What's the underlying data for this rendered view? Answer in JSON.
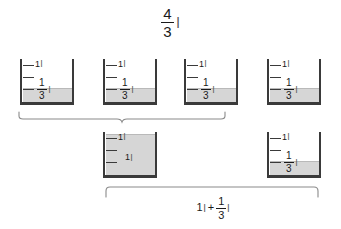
{
  "diagram": {
    "title_expression": {
      "numerator": "4",
      "denominator": "3",
      "unit": "l"
    },
    "sum_expression": {
      "whole": "1",
      "whole_unit": "l",
      "operator": "+",
      "numerator": "1",
      "denominator": "3",
      "unit": "l"
    },
    "beaker_scale_top_label": "1",
    "beaker_scale_top_unit": "l",
    "row_top": {
      "beakers": [
        {
          "id": "beaker-top-1",
          "top_label": "1",
          "top_unit": "l",
          "level_numerator": "1",
          "level_denominator": "3",
          "level_unit": "l",
          "fill_fraction": "1/3",
          "fill_height_px": 13,
          "x": 20
        },
        {
          "id": "beaker-top-2",
          "top_label": "1",
          "top_unit": "l",
          "level_numerator": "1",
          "level_denominator": "3",
          "level_unit": "l",
          "fill_fraction": "1/3",
          "fill_height_px": 13,
          "x": 103
        },
        {
          "id": "beaker-top-3",
          "top_label": "1",
          "top_unit": "l",
          "level_numerator": "1",
          "level_denominator": "3",
          "level_unit": "l",
          "fill_fraction": "1/3",
          "fill_height_px": 13,
          "x": 184
        },
        {
          "id": "beaker-top-4",
          "top_label": "1",
          "top_unit": "l",
          "level_numerator": "1",
          "level_denominator": "3",
          "level_unit": "l",
          "fill_fraction": "1/3",
          "fill_height_px": 13,
          "x": 267
        }
      ]
    },
    "row_bottom": {
      "beakers": [
        {
          "id": "beaker-bottom-full",
          "top_label": "1",
          "top_unit": "l",
          "center_label": "1",
          "center_unit": "l",
          "fill_fraction": "1",
          "fill_height_px": 40,
          "x": 103
        },
        {
          "id": "beaker-bottom-third",
          "top_label": "1",
          "top_unit": "l",
          "level_numerator": "1",
          "level_denominator": "3",
          "level_unit": "l",
          "fill_fraction": "1/3",
          "fill_height_px": 13,
          "x": 267
        }
      ]
    },
    "braces": {
      "top": {
        "label": "4/3 l",
        "x": 18,
        "y": 111,
        "width": 206
      },
      "bottom": {
        "label": "1 l + 1/3 l",
        "x": 105,
        "y": 185,
        "width": 216
      }
    },
    "colors": {
      "glass_stroke": "#3a3a3a",
      "water_fill": "#d6d6d6",
      "water_surface": "#b9b9b9",
      "brace_stroke": "#8a8a8a",
      "text": "#1a1a1a",
      "background": "#ffffff"
    }
  }
}
